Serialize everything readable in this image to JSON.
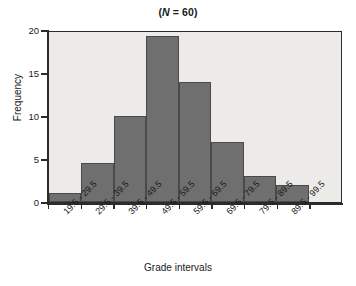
{
  "chart_data": {
    "type": "bar",
    "title": "(N = 60)",
    "title_parts": {
      "prefix": "(",
      "italic": "N",
      "suffix": " = 60)"
    },
    "xlabel": "Grade intervals",
    "ylabel": "Frequency",
    "categories": [
      "19.5 - 29.5",
      "29.5 - 39.5",
      "39.5 - 49.5",
      "49.5 - 59.5",
      "59.5 - 69.5",
      "69.5 - 79.5",
      "79.5 - 89.5",
      "89.5 - 99.5"
    ],
    "values": [
      1,
      4.5,
      10,
      19.3,
      14,
      7,
      3,
      2
    ],
    "ylim": [
      0,
      20
    ],
    "yticks": [
      0,
      5,
      10,
      15,
      20
    ],
    "ytick_labels": [
      "0",
      "5",
      "10",
      "15",
      "20"
    ],
    "grid": false,
    "legend": "none",
    "bar_color": "#6f6f6f",
    "bar_edge_color": "#4a4a4a",
    "plot_background": "#ecebe8",
    "axis_color": "#2b2b2b"
  }
}
